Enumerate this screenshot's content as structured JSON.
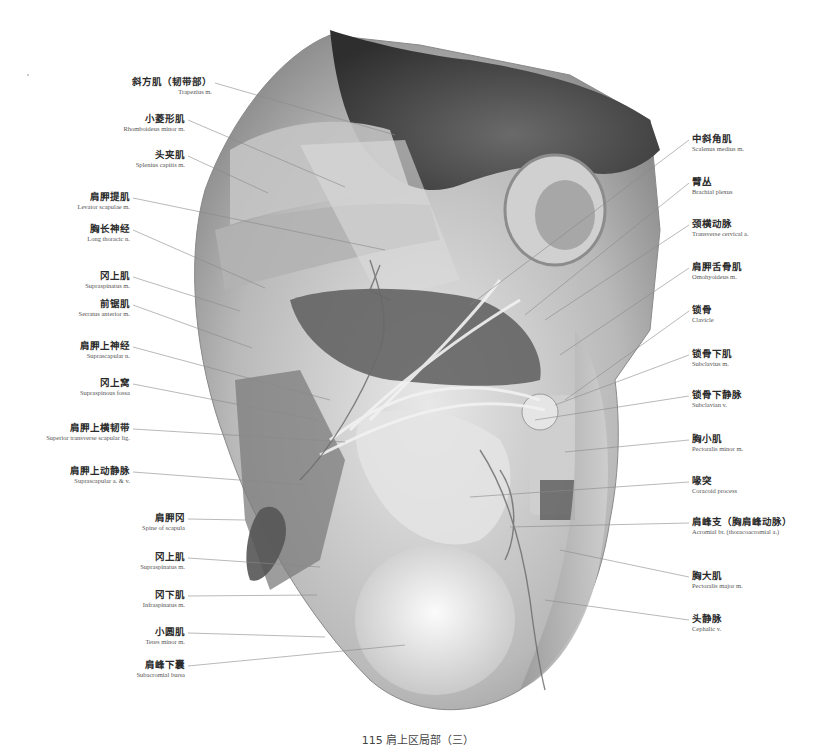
{
  "figure": {
    "caption": "115  肩上区局部（三）",
    "colors": {
      "background": "#ffffff",
      "ink": "#2a2a2a",
      "leader": "#8a8a8a"
    }
  },
  "labels_left": [
    {
      "zh": "斜方肌（韧带部）",
      "en": "Trapezius m.",
      "x": 212,
      "y": 83,
      "tx": 395,
      "ty": 135
    },
    {
      "zh": "小菱形肌",
      "en": "Rhomboideus minor m.",
      "x": 185,
      "y": 120,
      "tx": 345,
      "ty": 187
    },
    {
      "zh": "头夹肌",
      "en": "Splenius capitis m.",
      "x": 185,
      "y": 156,
      "tx": 268,
      "ty": 193
    },
    {
      "zh": "肩胛提肌",
      "en": "Levator scapulae m.",
      "x": 130,
      "y": 198,
      "tx": 385,
      "ty": 250
    },
    {
      "zh": "胸长神经",
      "en": "Long thoracic n.",
      "x": 130,
      "y": 230,
      "tx": 265,
      "ty": 288
    },
    {
      "zh": "冈上肌",
      "en": "Supraspinatus m.",
      "x": 130,
      "y": 277,
      "tx": 240,
      "ty": 311
    },
    {
      "zh": "前锯肌",
      "en": "Serratus anterior m.",
      "x": 130,
      "y": 305,
      "tx": 252,
      "ty": 348
    },
    {
      "zh": "肩胛上神经",
      "en": "Suprascapular n.",
      "x": 130,
      "y": 347,
      "tx": 330,
      "ty": 400
    },
    {
      "zh": "冈上窝",
      "en": "Supraspinous fossa",
      "x": 130,
      "y": 384,
      "tx": 318,
      "ty": 420
    },
    {
      "zh": "肩胛上横韧带",
      "en": "Superior transverse scapular lig.",
      "x": 130,
      "y": 429,
      "tx": 345,
      "ty": 442
    },
    {
      "zh": "肩胛上动静脉",
      "en": "Suprascapular a. & v.",
      "x": 130,
      "y": 472,
      "tx": 305,
      "ty": 485
    },
    {
      "zh": "肩胛冈",
      "en": "Spine of scapula",
      "x": 185,
      "y": 519,
      "tx": 245,
      "ty": 520
    },
    {
      "zh": "冈上肌",
      "en": "Supraspinatus m.",
      "x": 185,
      "y": 558,
      "tx": 320,
      "ty": 567
    },
    {
      "zh": "冈下肌",
      "en": "Infraspinatus m.",
      "x": 185,
      "y": 596,
      "tx": 317,
      "ty": 595
    },
    {
      "zh": "小圆肌",
      "en": "Teres minor m.",
      "x": 185,
      "y": 633,
      "tx": 325,
      "ty": 637
    },
    {
      "zh": "肩峰下囊",
      "en": "Subacromial bursa",
      "x": 185,
      "y": 666,
      "tx": 405,
      "ty": 645
    }
  ],
  "labels_right": [
    {
      "zh": "中斜角肌",
      "en": "Scalenus medius m.",
      "x": 692,
      "y": 140,
      "tx": 470,
      "ty": 305
    },
    {
      "zh": "臂丛",
      "en": "Brachial plexus",
      "x": 692,
      "y": 183,
      "tx": 525,
      "ty": 315
    },
    {
      "zh": "颈横动脉",
      "en": "Transverse cervical a.",
      "x": 692,
      "y": 225,
      "tx": 545,
      "ty": 320
    },
    {
      "zh": "肩胛舌骨肌",
      "en": "Omohyoideus m.",
      "x": 692,
      "y": 268,
      "tx": 560,
      "ty": 355
    },
    {
      "zh": "锁骨",
      "en": "Clavicle",
      "x": 692,
      "y": 311,
      "tx": 565,
      "ty": 400
    },
    {
      "zh": "锁骨下肌",
      "en": "Subclavius m.",
      "x": 692,
      "y": 355,
      "tx": 555,
      "ty": 405
    },
    {
      "zh": "锁骨下静脉",
      "en": "Subclavian v.",
      "x": 692,
      "y": 396,
      "tx": 535,
      "ty": 420
    },
    {
      "zh": "胸小肌",
      "en": "Pectoralis minor m.",
      "x": 692,
      "y": 440,
      "tx": 565,
      "ty": 452
    },
    {
      "zh": "喙突",
      "en": "Coracoid process",
      "x": 692,
      "y": 482,
      "tx": 470,
      "ty": 497
    },
    {
      "zh": "肩峰支（胸肩峰动脉）",
      "en": "Acromial br. (thoracoacromial a.)",
      "x": 692,
      "y": 523,
      "tx": 510,
      "ty": 527
    },
    {
      "zh": "胸大肌",
      "en": "Pectoralis major m.",
      "x": 692,
      "y": 577,
      "tx": 560,
      "ty": 550
    },
    {
      "zh": "头静脉",
      "en": "Cephalic v.",
      "x": 692,
      "y": 620,
      "tx": 545,
      "ty": 600
    }
  ]
}
